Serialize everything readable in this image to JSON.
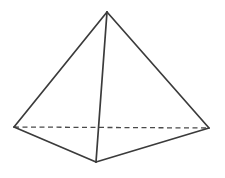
{
  "figure": {
    "shape_type": "tetrahedron",
    "background_color": "#fdfdfd",
    "visible_edge_color": "#3b3b3b",
    "hidden_edge_color": "#4a4a4a",
    "visible_edge_width": 1.7,
    "hidden_edge_width": 1.3,
    "hidden_edge_dash": "5,3.5",
    "canvas": {
      "width": 225,
      "height": 178
    },
    "vertices": [
      {
        "name": "apex",
        "label": "apex",
        "x": 107,
        "y": 12
      },
      {
        "name": "base-left",
        "label": "base left",
        "x": 14,
        "y": 127
      },
      {
        "name": "base-right",
        "label": "base right",
        "x": 209,
        "y": 128
      },
      {
        "name": "base-front",
        "label": "base front",
        "x": 96,
        "y": 162
      }
    ],
    "edges": [
      {
        "name": "apex-to-base-left",
        "from": "apex",
        "to": "base-left",
        "style": "solid"
      },
      {
        "name": "apex-to-base-right",
        "from": "apex",
        "to": "base-right",
        "style": "solid"
      },
      {
        "name": "apex-to-base-front",
        "from": "apex",
        "to": "base-front",
        "style": "solid"
      },
      {
        "name": "base-left-to-base-front",
        "from": "base-left",
        "to": "base-front",
        "style": "solid"
      },
      {
        "name": "base-front-to-base-right",
        "from": "base-front",
        "to": "base-right",
        "style": "solid"
      },
      {
        "name": "base-left-to-base-right",
        "from": "base-left",
        "to": "base-right",
        "style": "dashed"
      }
    ]
  }
}
